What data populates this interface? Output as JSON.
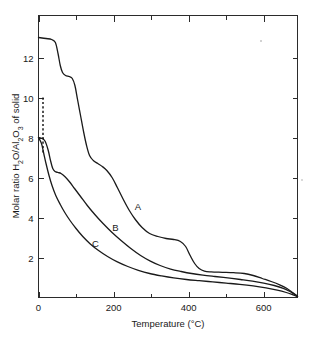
{
  "chart_data": {
    "type": "line",
    "title": "",
    "xlabel": "Temperature  (°C)",
    "ylabel": "Molar ratio H2O/Al2O3 of solid",
    "ylabel_parts": {
      "prefix": "Molar ratio H",
      "sub1": "2",
      "mid": "O/Al",
      "sub2": "2",
      "mid2": "O",
      "sub3": "3",
      "suffix": " of solid"
    },
    "xlabel_parts": {
      "name": "Temperature",
      "units": "(°C)"
    },
    "xlim": [
      0,
      690
    ],
    "ylim": [
      0,
      13.6
    ],
    "x_ticks_major": [
      0,
      200,
      400,
      600
    ],
    "x_tick_labels": [
      "0",
      "200",
      "400",
      "600"
    ],
    "x_ticks_minor": [
      100,
      300,
      500
    ],
    "y_ticks_major": [
      2,
      4,
      6,
      8,
      10,
      12
    ],
    "y_tick_labels": [
      "2",
      "4",
      "6",
      "8",
      "10",
      "12"
    ],
    "grid": false,
    "legend": "inline-curve-labels",
    "annotations": [
      {
        "text": "A",
        "x": 265,
        "y": 4.4
      },
      {
        "text": "B",
        "x": 205,
        "y": 3.35
      },
      {
        "text": "C",
        "x": 152,
        "y": 2.55
      }
    ],
    "dashed_segment": {
      "label": "extrapolated-initial-composition",
      "x": 12,
      "y_from": 10.0,
      "y_to": 7.2
    },
    "series": [
      {
        "name": "A",
        "points": [
          [
            0,
            13.0
          ],
          [
            20,
            12.95
          ],
          [
            35,
            12.9
          ],
          [
            45,
            12.75
          ],
          [
            52,
            12.2
          ],
          [
            58,
            11.6
          ],
          [
            64,
            11.25
          ],
          [
            72,
            11.1
          ],
          [
            82,
            11.05
          ],
          [
            90,
            10.95
          ],
          [
            97,
            10.6
          ],
          [
            104,
            9.9
          ],
          [
            112,
            9.1
          ],
          [
            120,
            8.3
          ],
          [
            128,
            7.6
          ],
          [
            136,
            7.1
          ],
          [
            146,
            6.85
          ],
          [
            158,
            6.7
          ],
          [
            170,
            6.55
          ],
          [
            182,
            6.35
          ],
          [
            196,
            6.0
          ],
          [
            210,
            5.5
          ],
          [
            226,
            4.9
          ],
          [
            242,
            4.35
          ],
          [
            258,
            3.9
          ],
          [
            276,
            3.5
          ],
          [
            296,
            3.2
          ],
          [
            318,
            3.05
          ],
          [
            340,
            2.95
          ],
          [
            360,
            2.9
          ],
          [
            378,
            2.8
          ],
          [
            392,
            2.55
          ],
          [
            404,
            2.1
          ],
          [
            416,
            1.7
          ],
          [
            428,
            1.45
          ],
          [
            442,
            1.32
          ],
          [
            460,
            1.28
          ],
          [
            490,
            1.26
          ],
          [
            520,
            1.24
          ],
          [
            548,
            1.2
          ],
          [
            572,
            1.1
          ],
          [
            596,
            0.95
          ],
          [
            620,
            0.8
          ],
          [
            644,
            0.62
          ],
          [
            662,
            0.45
          ],
          [
            676,
            0.26
          ],
          [
            686,
            0.12
          ],
          [
            690,
            0.05
          ]
        ]
      },
      {
        "name": "B",
        "points": [
          [
            0,
            8.0
          ],
          [
            10,
            7.95
          ],
          [
            18,
            7.8
          ],
          [
            26,
            7.35
          ],
          [
            32,
            6.85
          ],
          [
            38,
            6.45
          ],
          [
            44,
            6.3
          ],
          [
            52,
            6.25
          ],
          [
            60,
            6.2
          ],
          [
            70,
            6.05
          ],
          [
            82,
            5.8
          ],
          [
            96,
            5.45
          ],
          [
            112,
            5.05
          ],
          [
            130,
            4.6
          ],
          [
            150,
            4.15
          ],
          [
            172,
            3.7
          ],
          [
            196,
            3.25
          ],
          [
            220,
            2.85
          ],
          [
            246,
            2.45
          ],
          [
            272,
            2.1
          ],
          [
            298,
            1.82
          ],
          [
            324,
            1.6
          ],
          [
            352,
            1.42
          ],
          [
            380,
            1.3
          ],
          [
            408,
            1.2
          ],
          [
            438,
            1.12
          ],
          [
            470,
            1.05
          ],
          [
            504,
            0.98
          ],
          [
            538,
            0.9
          ],
          [
            570,
            0.82
          ],
          [
            600,
            0.72
          ],
          [
            628,
            0.6
          ],
          [
            652,
            0.46
          ],
          [
            670,
            0.3
          ],
          [
            682,
            0.16
          ],
          [
            690,
            0.06
          ]
        ]
      },
      {
        "name": "C",
        "points": [
          [
            0,
            8.0
          ],
          [
            8,
            7.7
          ],
          [
            14,
            7.2
          ],
          [
            20,
            6.7
          ],
          [
            28,
            6.1
          ],
          [
            36,
            5.6
          ],
          [
            46,
            5.1
          ],
          [
            58,
            4.65
          ],
          [
            70,
            4.25
          ],
          [
            84,
            3.85
          ],
          [
            100,
            3.45
          ],
          [
            118,
            3.05
          ],
          [
            138,
            2.68
          ],
          [
            160,
            2.35
          ],
          [
            184,
            2.05
          ],
          [
            210,
            1.78
          ],
          [
            238,
            1.55
          ],
          [
            266,
            1.36
          ],
          [
            296,
            1.2
          ],
          [
            328,
            1.08
          ],
          [
            360,
            0.98
          ],
          [
            394,
            0.9
          ],
          [
            428,
            0.84
          ],
          [
            464,
            0.78
          ],
          [
            500,
            0.72
          ],
          [
            536,
            0.66
          ],
          [
            572,
            0.58
          ],
          [
            606,
            0.48
          ],
          [
            636,
            0.37
          ],
          [
            660,
            0.25
          ],
          [
            678,
            0.13
          ],
          [
            690,
            0.04
          ]
        ]
      }
    ]
  }
}
